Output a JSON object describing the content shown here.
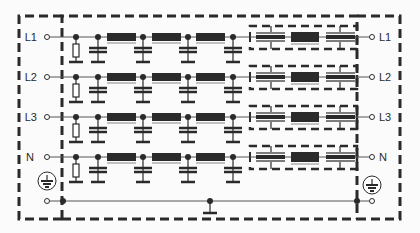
{
  "diagram": {
    "type": "circuit-schematic",
    "colors": {
      "line": "#2a2a2a",
      "wire": "#555555",
      "background": "#fbfbfb"
    },
    "left_terminals": [
      {
        "label": "L1",
        "y": 37
      },
      {
        "label": "L2",
        "y": 77
      },
      {
        "label": "L3",
        "y": 117
      },
      {
        "label": "N",
        "y": 157
      }
    ],
    "right_terminals": [
      {
        "label": "L1",
        "y": 37
      },
      {
        "label": "L2",
        "y": 77
      },
      {
        "label": "L3",
        "y": 117
      },
      {
        "label": "N",
        "y": 157
      }
    ],
    "earth": {
      "left_symbol": "protective-earth-icon",
      "right_symbol": "protective-earth-icon",
      "bus_y": 201
    },
    "row_components": [
      "bleeder-resistor",
      "x-capacitor",
      "inductor",
      "y-capacitor",
      "inductor",
      "y-capacitor",
      "inductor",
      "y-capacitor",
      "feedthrough-capacitor",
      "inductor",
      "feedthrough-capacitor"
    ],
    "enclosures": [
      "outer-dashed-enclosure",
      "inner-filter-section",
      "feedthrough-shield-boxes"
    ]
  }
}
